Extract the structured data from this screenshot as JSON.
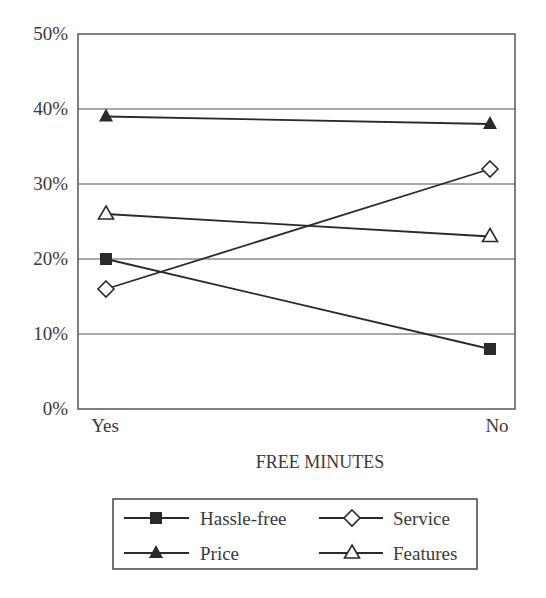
{
  "chart_data": {
    "type": "line",
    "title": "",
    "xlabel": "FREE MINUTES",
    "ylabel": "",
    "categories": [
      "Yes",
      "No"
    ],
    "ylim": [
      0,
      50
    ],
    "yticks": [
      0,
      10,
      20,
      30,
      40,
      50
    ],
    "ytick_labels": [
      "0%",
      "10%",
      "20%",
      "30%",
      "40%",
      "50%"
    ],
    "grid": true,
    "legend_position": "bottom",
    "series": [
      {
        "name": "Hassle-free",
        "marker": "square-filled",
        "values": [
          20,
          8
        ]
      },
      {
        "name": "Service",
        "marker": "diamond-open",
        "values": [
          16,
          32
        ]
      },
      {
        "name": "Price",
        "marker": "triangle-filled",
        "values": [
          39,
          38
        ]
      },
      {
        "name": "Features",
        "marker": "triangle-open",
        "values": [
          26,
          23
        ]
      }
    ]
  },
  "legend": {
    "items": [
      {
        "label": "Hassle-free",
        "marker": "square-filled"
      },
      {
        "label": "Service",
        "marker": "diamond-open"
      },
      {
        "label": "Price",
        "marker": "triangle-filled"
      },
      {
        "label": "Features",
        "marker": "triangle-open"
      }
    ]
  },
  "colors": {
    "line": "#2a2a2a",
    "grid": "#555555",
    "frame": "#555555",
    "text": "#3a3a3a"
  }
}
